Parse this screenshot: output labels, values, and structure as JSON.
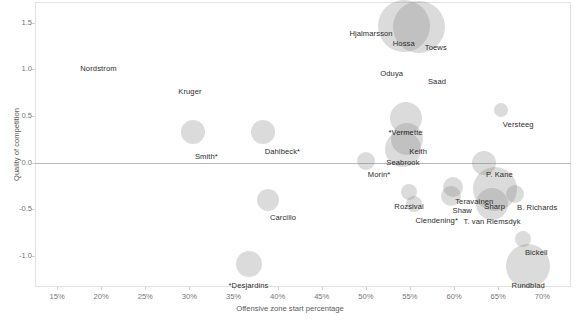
{
  "chart_data": {
    "type": "scatter",
    "title": "",
    "subtitle": "",
    "xlabel": "Offensive zone start percentage",
    "ylabel": "Quality of competition",
    "xlim": [
      0.125,
      0.7325
    ],
    "ylim": [
      -1.33,
      1.72
    ],
    "xticks": [
      "15%",
      "20%",
      "25%",
      "30%",
      "35%",
      "40%",
      "45%",
      "50%",
      "55%",
      "60%",
      "65%",
      "70%"
    ],
    "xtick_values": [
      15,
      20,
      25,
      30,
      35,
      40,
      45,
      50,
      55,
      60,
      65,
      70
    ],
    "yticks": [
      "1.5",
      "1.0",
      "0.5",
      "0.0",
      "-0.5",
      "-1.0"
    ],
    "ytick_values": [
      1.5,
      1.0,
      0.5,
      0.0,
      -0.5,
      -1.0
    ],
    "grid": false,
    "legend": "none",
    "zero_reference_line": 0.0,
    "bubble_color": "#7d7d7d",
    "bubble_opacity": 0.28,
    "size_note": "bubble area encodes ice time",
    "points": [
      {
        "name": "Nordstrom",
        "x": 16.5,
        "y": 1.0,
        "size": 0,
        "label_dx": 10,
        "label_dy": 0
      },
      {
        "name": "Kruger",
        "x": 27.6,
        "y": 0.76,
        "size": 0,
        "label_dx": 10,
        "label_dy": 0
      },
      {
        "name": "Hjalmarsson",
        "x": 47.0,
        "y": 1.38,
        "size": 0,
        "label_dx": 10,
        "label_dy": 0
      },
      {
        "name": "Hossa",
        "x": 54.3,
        "y": 1.46,
        "size": 26,
        "label_dx": 0,
        "label_dy": 18
      },
      {
        "name": "Toews",
        "x": 56.0,
        "y": 1.45,
        "size": 26,
        "label_dx": 6,
        "label_dy": 21
      },
      {
        "name": "Oduya",
        "x": 50.5,
        "y": 0.95,
        "size": 0,
        "label_dx": 10,
        "label_dy": 0
      },
      {
        "name": "Saad",
        "x": 55.9,
        "y": 0.86,
        "size": 0,
        "label_dx": 10,
        "label_dy": 0
      },
      {
        "name": "Versteeg",
        "x": 65.3,
        "y": 0.56,
        "size": 7,
        "label_dx": 2,
        "label_dy": 15
      },
      {
        "name": "*Vermette",
        "x": 54.5,
        "y": 0.48,
        "size": 16,
        "label_dx": 0,
        "label_dy": 15
      },
      {
        "name": "Keith",
        "x": 54.7,
        "y": 0.25,
        "size": 16,
        "label_dx": 2,
        "label_dy": 13
      },
      {
        "name": "Seabrook",
        "x": 54.2,
        "y": 0.15,
        "size": 18,
        "label_dx": 0,
        "label_dy": 14
      },
      {
        "name": "Smith*",
        "x": 30.4,
        "y": 0.33,
        "size": 12,
        "label_dx": 2,
        "label_dy": 25
      },
      {
        "name": "Dahlbeck*",
        "x": 38.3,
        "y": 0.33,
        "size": 12,
        "label_dx": 2,
        "label_dy": 20
      },
      {
        "name": "Morin*",
        "x": 50.0,
        "y": 0.02,
        "size": 9,
        "label_dx": 2,
        "label_dy": 14
      },
      {
        "name": "P. Kane",
        "x": 63.4,
        "y": 0.0,
        "size": 12,
        "label_dx": 2,
        "label_dy": 12
      },
      {
        "name": "Carcillo",
        "x": 38.9,
        "y": -0.4,
        "size": 11,
        "label_dx": 2,
        "label_dy": 18
      },
      {
        "name": "Rozsival",
        "x": 54.9,
        "y": -0.31,
        "size": 8,
        "label_dx": 0,
        "label_dy": 15
      },
      {
        "name": "Clendening*",
        "x": 55.4,
        "y": -0.44,
        "size": 8,
        "label_dx": 2,
        "label_dy": 17
      },
      {
        "name": "Teravainen",
        "x": 59.9,
        "y": -0.26,
        "size": 10,
        "label_dx": 2,
        "label_dy": 15
      },
      {
        "name": "Shaw",
        "x": 59.6,
        "y": -0.36,
        "size": 10,
        "label_dx": 2,
        "label_dy": 15
      },
      {
        "name": "Sharp",
        "x": 64.6,
        "y": -0.28,
        "size": 22,
        "label_dx": 0,
        "label_dy": 18
      },
      {
        "name": "T. van Riemsdyk",
        "x": 64.3,
        "y": -0.44,
        "size": 16,
        "label_dx": 0,
        "label_dy": 18
      },
      {
        "name": "B. Richards",
        "x": 66.9,
        "y": -0.33,
        "size": 9,
        "label_dx": 2,
        "label_dy": 14
      },
      {
        "name": "Bickell",
        "x": 67.8,
        "y": -0.82,
        "size": 8,
        "label_dx": 2,
        "label_dy": 14
      },
      {
        "name": "Rundblad",
        "x": 68.4,
        "y": -1.1,
        "size": 22,
        "label_dx": 0,
        "label_dy": 20
      },
      {
        "name": "*Desjardins",
        "x": 36.7,
        "y": -1.08,
        "size": 13,
        "label_dx": 0,
        "label_dy": 22
      }
    ]
  }
}
